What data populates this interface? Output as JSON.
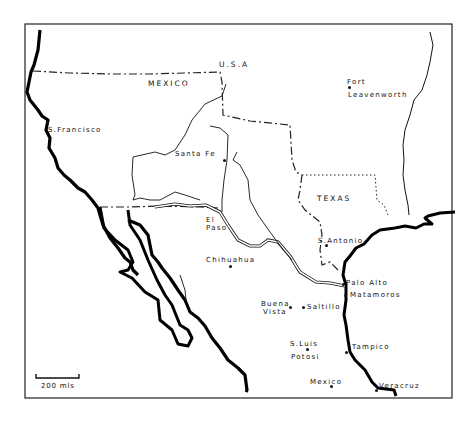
{
  "map": {
    "frame_color": "#222222",
    "region_labels": {
      "usa": "U.S.A",
      "mexico": "MEXICO",
      "texas": "TEXAS"
    },
    "places": {
      "san_francisco": "S.Francisco",
      "santa_fe": "Santa Fe",
      "fort_leavenworth_1": "Fort",
      "fort_leavenworth_2": "Leavenworth",
      "el_paso_1": "El",
      "el_paso_2": "Paso",
      "chihuahua": "Chihuahua",
      "san_antonio": "S.Antonio",
      "palo_alto": "Palo Alto",
      "matamoros": "Matamoros",
      "buena_vista_1": "Buena",
      "buena_vista_2": "Vista",
      "saltillo": "Saltillo",
      "san_luis_potosi_1": "S.Luis",
      "san_luis_potosi_2": "Potosi",
      "tampico": "Tampico",
      "mexico_city": "Mexico",
      "veracruz": "Veracruz"
    },
    "scale_bar": {
      "label": "200 mls"
    }
  }
}
